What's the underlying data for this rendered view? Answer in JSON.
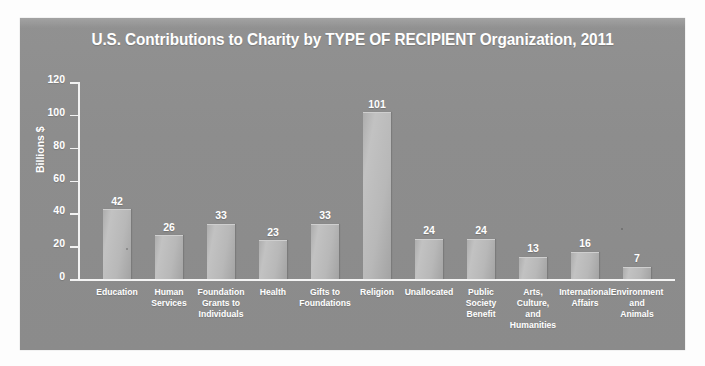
{
  "panel": {
    "background_color": "#8e8e8e"
  },
  "chart_data": {
    "type": "bar",
    "title": "U.S. Contributions to Charity by TYPE OF RECIPIENT Organization, 2011",
    "xlabel": "",
    "ylabel": "Billions $",
    "ylim": [
      0,
      120
    ],
    "ytick_labels": [
      "120",
      "100",
      "80",
      "60",
      "40",
      "20",
      "0"
    ],
    "yticks": [
      120,
      100,
      80,
      60,
      40,
      20,
      0
    ],
    "grid": false,
    "legend": false,
    "bar_color": "#bcbcbc",
    "text_color": "#ffffff",
    "categories": [
      "Education",
      "Human\nServices",
      "Foundation\nGrants to\nIndividuals",
      "Health",
      "Gifts to\nFoundations",
      "Religion",
      "Unallocated",
      "Public\nSociety\nBenefit",
      "Arts,\nCulture,\nand\nHumanities",
      "International\nAffairs",
      "Environment\nand\nAnimals"
    ],
    "values": [
      42,
      26,
      33,
      23,
      33,
      101,
      24,
      24,
      13,
      16,
      7
    ],
    "value_labels": [
      "42",
      "26",
      "33",
      "23",
      "33",
      "101",
      "24",
      "24",
      "13",
      "16",
      "7"
    ]
  }
}
